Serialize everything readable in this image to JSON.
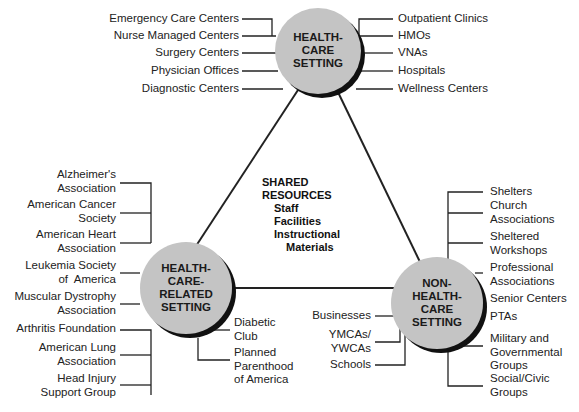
{
  "nodes": {
    "top": {
      "label": "HEALTH-\nCARE\nSETTING"
    },
    "left": {
      "label": "HEALTH-\nCARE-\nRELATED\nSETTING"
    },
    "right": {
      "label": "NON-\nHEALTH-\nCARE\nSETTING"
    }
  },
  "center": {
    "title": "SHARED\nRESOURCES",
    "items": [
      "Staff",
      "Facilities",
      "Instructional",
      "Materials"
    ]
  },
  "top_left_items": [
    "Emergency Care Centers",
    "Nurse Managed Centers",
    "Surgery Centers",
    "Physician Offices",
    "Diagnostic Centers"
  ],
  "top_right_items": [
    "Outpatient Clinics",
    "HMOs",
    "VNAs",
    "Hospitals",
    "Wellness Centers"
  ],
  "left_items": [
    "Alzheimer's\nAssociation",
    "American Cancer\nSociety",
    "American Heart\nAssociation",
    "Leukemia Society\nof  America",
    "Muscular Dystrophy\nAssociation",
    "Arthritis Foundation",
    "American Lung\nAssociation",
    "Head Injury\nSupport Group"
  ],
  "left_bottom_items": [
    "Diabetic\nClub",
    "Planned\nParenthood\nof America"
  ],
  "right_left_items": [
    "Businesses",
    "YMCAs/\nYWCAs",
    "Schools"
  ],
  "right_items": [
    "Shelters",
    "Church\nAssociations",
    "Sheltered\nWorkshops",
    "Professional\nAssociations",
    "Senior Centers",
    "PTAs",
    "Military and\nGovernmental\nGroups",
    "Social/Civic\nGroups"
  ],
  "colors": {
    "circle_fill": "#c4c4c4",
    "circle_shadow": "#111111",
    "line": "#222222"
  }
}
